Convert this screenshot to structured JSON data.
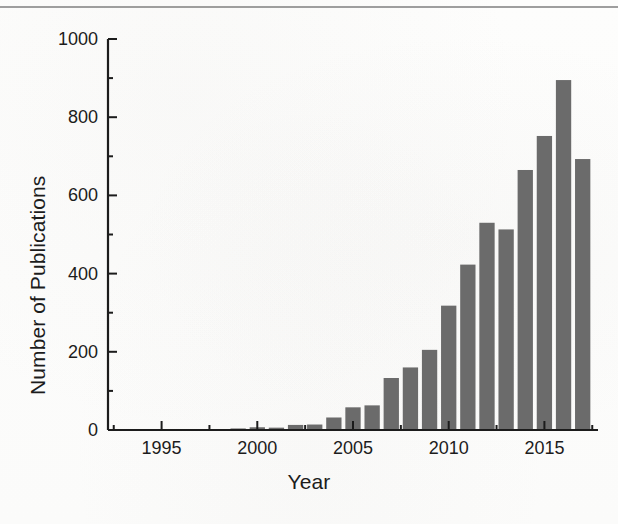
{
  "figure": {
    "background_color": "#fdfdfc",
    "bar_color": "#6b6b6b",
    "axis_color": "#1c1c1c",
    "rule_color": "#8d8d8d"
  },
  "chart_data": {
    "type": "bar",
    "title": "",
    "xlabel": "Year",
    "ylabel": "Number of Publications",
    "categories": [
      1993,
      1994,
      1995,
      1996,
      1997,
      1998,
      1999,
      2000,
      2001,
      2002,
      2003,
      2004,
      2005,
      2006,
      2007,
      2008,
      2009,
      2010,
      2011,
      2012,
      2013,
      2014,
      2015,
      2016,
      2017
    ],
    "values": [
      0,
      0,
      1,
      2,
      2,
      1,
      4,
      7,
      6,
      13,
      14,
      32,
      58,
      63,
      133,
      160,
      205,
      318,
      423,
      530,
      513,
      665,
      752,
      895,
      693
    ],
    "xlim": [
      1992.2,
      11.0
    ],
    "x_range": [
      1992.2,
      2017.8
    ],
    "ylim": [
      0,
      1000
    ],
    "ytick_labels": [
      "0",
      "200",
      "400",
      "600",
      "800",
      "1000"
    ],
    "ytick_values": [
      0,
      200,
      400,
      600,
      800,
      1000
    ],
    "y_minor_interval": 100,
    "xtick_labels": [
      "1995",
      "2000",
      "2005",
      "2010",
      "2015"
    ],
    "xtick_values": [
      1995,
      2000,
      2005,
      2010,
      2015
    ],
    "x_minor_interval": 2.5,
    "grid": false,
    "legend": null,
    "bar_width_years": 0.8
  }
}
